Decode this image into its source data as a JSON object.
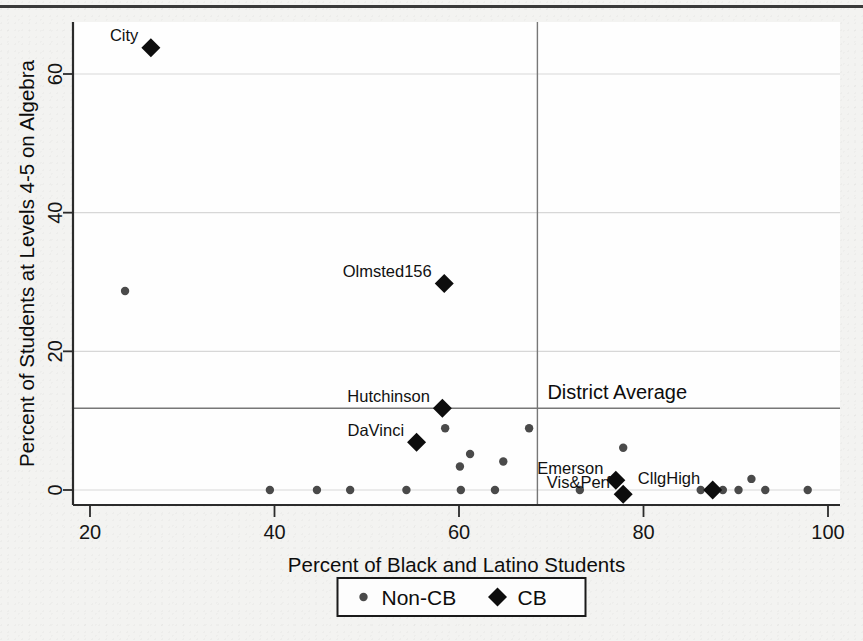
{
  "figure": {
    "background_color": "#f3f3f1",
    "plot_background_color": "#fefefe"
  },
  "chart_data": {
    "type": "scatter",
    "title": "",
    "xlabel": "Percent of Black and Latino Students",
    "ylabel": "Percent of Students at Levels 4-5 on Algebra",
    "xlim": [
      18,
      101
    ],
    "ylim": [
      -2.5,
      67
    ],
    "xticks": [
      20,
      40,
      60,
      80,
      100
    ],
    "xticklabels": [
      "20",
      "40",
      "60",
      "80",
      "100"
    ],
    "yticks": [
      0,
      20,
      40,
      60
    ],
    "yticklabels": [
      "0",
      "20",
      "40",
      "60"
    ],
    "grid": true,
    "grid_axis": "y",
    "legend_position": "below-axis-center",
    "reference_lines": {
      "label": "District Average",
      "vertical_x": 68.5,
      "horizontal_y": 11.8,
      "color": "#777777"
    },
    "legend": [
      {
        "name": "Non-CB",
        "marker": "circle",
        "color": "#4a4a4a"
      },
      {
        "name": "CB",
        "marker": "diamond",
        "color": "#0d0d0d"
      }
    ],
    "series": [
      {
        "name": "Non-CB",
        "marker": "circle",
        "color": "#4a4a4a",
        "points": [
          {
            "x": 23.8,
            "y": 28.7
          },
          {
            "x": 39.5,
            "y": 0.0
          },
          {
            "x": 44.6,
            "y": 0.0
          },
          {
            "x": 48.2,
            "y": 0.0
          },
          {
            "x": 54.3,
            "y": 0.0
          },
          {
            "x": 60.2,
            "y": 0.0
          },
          {
            "x": 63.9,
            "y": 0.0
          },
          {
            "x": 58.5,
            "y": 8.9
          },
          {
            "x": 61.2,
            "y": 5.2
          },
          {
            "x": 60.1,
            "y": 3.4
          },
          {
            "x": 64.8,
            "y": 4.1
          },
          {
            "x": 67.6,
            "y": 8.9
          },
          {
            "x": 73.1,
            "y": 0.0
          },
          {
            "x": 77.8,
            "y": 6.1
          },
          {
            "x": 86.2,
            "y": 0.0
          },
          {
            "x": 88.6,
            "y": 0.0
          },
          {
            "x": 90.3,
            "y": 0.0
          },
          {
            "x": 91.7,
            "y": 1.6
          },
          {
            "x": 93.2,
            "y": 0.0
          },
          {
            "x": 97.8,
            "y": 0.0
          }
        ]
      },
      {
        "name": "CB",
        "marker": "diamond",
        "color": "#0d0d0d",
        "points": [
          {
            "x": 26.6,
            "y": 63.8,
            "label": "City",
            "label_pos": "left-above"
          },
          {
            "x": 58.4,
            "y": 29.8,
            "label": "Olmsted156",
            "label_pos": "left-above"
          },
          {
            "x": 58.2,
            "y": 11.8,
            "label": "Hutchinson",
            "label_pos": "left-above"
          },
          {
            "x": 55.4,
            "y": 6.9,
            "label": "DaVinci",
            "label_pos": "left-above"
          },
          {
            "x": 77.0,
            "y": 1.4,
            "label": "Emerson",
            "label_pos": "left-above"
          },
          {
            "x": 77.8,
            "y": -0.6,
            "label": "Vis&Perf",
            "label_pos": "left-above"
          },
          {
            "x": 87.5,
            "y": 0.0,
            "label": "CllgHigh",
            "label_pos": "left-above"
          }
        ]
      }
    ],
    "annotations": [
      {
        "text": "City",
        "x": 26.6,
        "y": 63.8
      },
      {
        "text": "Olmsted156",
        "x": 58.4,
        "y": 29.8
      },
      {
        "text": "Hutchinson",
        "x": 58.2,
        "y": 11.8
      },
      {
        "text": "DaVinci",
        "x": 55.4,
        "y": 6.9
      },
      {
        "text": "Emerson",
        "x": 77.0,
        "y": 1.4
      },
      {
        "text": "Vis&Perf",
        "x": 77.8,
        "y": -0.6
      },
      {
        "text": "CllgHigh",
        "x": 87.5,
        "y": 0.0
      },
      {
        "text": "District Average",
        "x": 70.0,
        "y": 14.2
      }
    ]
  }
}
